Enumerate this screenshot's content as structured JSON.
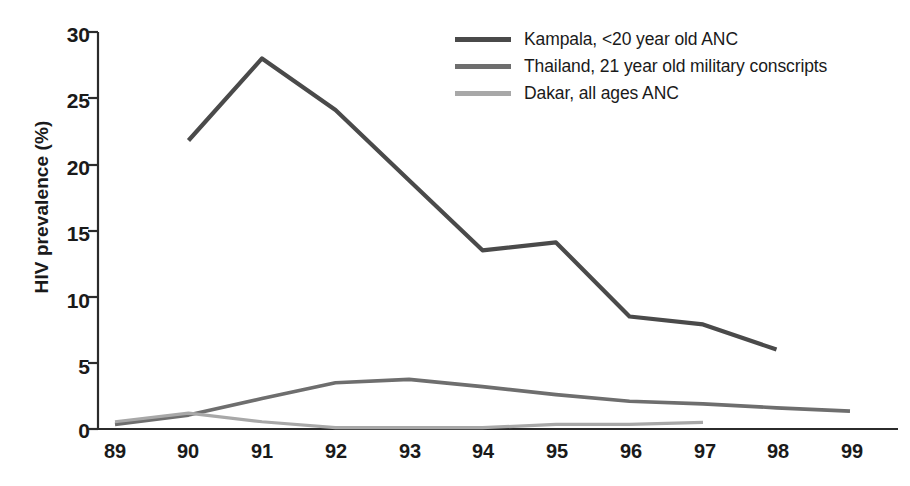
{
  "chart_data": {
    "type": "line",
    "title": "",
    "xlabel": "",
    "ylabel": "HIV prevalence (%)",
    "xlim": [
      89,
      99
    ],
    "ylim": [
      0,
      30
    ],
    "grid": false,
    "legend_position": "top-right",
    "x_tick_labels": [
      "89",
      "90",
      "91",
      "92",
      "93",
      "94",
      "95",
      "96",
      "97",
      "98",
      "99"
    ],
    "y_tick_labels": [
      "0",
      "5",
      "10",
      "15",
      "20",
      "25",
      "30"
    ],
    "y_ticks": [
      0,
      5,
      10,
      15,
      20,
      25,
      30
    ],
    "x_ticks": [
      89,
      90,
      91,
      92,
      93,
      94,
      95,
      96,
      97,
      98,
      99
    ],
    "series": [
      {
        "name": "Kampala, <20 year old ANC",
        "color": "#4a4a4a",
        "x": [
          90,
          91,
          92,
          93,
          94,
          95,
          96,
          97,
          98
        ],
        "values": [
          21.8,
          28.0,
          24.1,
          18.8,
          13.5,
          14.1,
          8.5,
          7.9,
          6.0
        ]
      },
      {
        "name": "Thailand, 21 year old military conscripts",
        "color": "#6e6e6e",
        "x": [
          89,
          90,
          91,
          92,
          93,
          94,
          95,
          96,
          97,
          98,
          99
        ],
        "values": [
          0.35,
          1.05,
          2.3,
          3.5,
          3.75,
          3.2,
          2.6,
          2.1,
          1.9,
          1.6,
          1.35
        ]
      },
      {
        "name": "Dakar, all ages ANC",
        "color": "#a8a8a8",
        "x": [
          89,
          90,
          91,
          92,
          93,
          94,
          95,
          96,
          97
        ],
        "values": [
          0.55,
          1.2,
          0.55,
          0.1,
          0.1,
          0.1,
          0.35,
          0.35,
          0.5
        ]
      }
    ]
  },
  "legend": {
    "items": [
      {
        "label": "Kampala, <20 year old ANC",
        "color": "#4a4a4a"
      },
      {
        "label": "Thailand, 21 year old military conscripts",
        "color": "#6e6e6e"
      },
      {
        "label": "Dakar, all ages ANC",
        "color": "#a8a8a8"
      }
    ]
  },
  "axis": {
    "y_title": "HIV prevalence (%)",
    "y_labels": [
      "30",
      "25",
      "20",
      "15",
      "10",
      "5",
      "0"
    ],
    "x_labels": [
      "89",
      "90",
      "91",
      "92",
      "93",
      "94",
      "95",
      "96",
      "97",
      "98",
      "99"
    ]
  },
  "colors": {
    "axis": "#2b2b2b",
    "background": "#ffffff",
    "text": "#1a1a1a",
    "series_dark": "#4a4a4a",
    "series_medium": "#6e6e6e",
    "series_light": "#a8a8a8"
  }
}
